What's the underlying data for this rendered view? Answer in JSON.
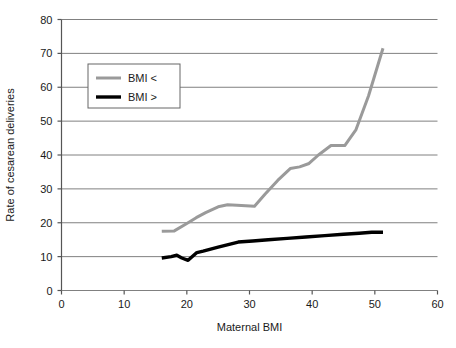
{
  "chart_data": {
    "type": "line",
    "title": "",
    "xlabel": "Maternal BMI",
    "ylabel": "Rate of cesarean deliveries",
    "xlim": [
      0,
      60
    ],
    "ylim": [
      0,
      80
    ],
    "xticks": [
      "0",
      "10",
      "20",
      "30",
      "40",
      "50",
      "60"
    ],
    "yticks": [
      "0",
      "10",
      "20",
      "30",
      "40",
      "50",
      "60",
      "70",
      "80"
    ],
    "xtick_step": 10,
    "ytick_step": 10,
    "grid": "horizontal",
    "legend_position": "upper-left-inside",
    "series": [
      {
        "name": "BMI <",
        "color": "#9a9a9a",
        "width": 3,
        "x": [
          16.0,
          18.0,
          20.0,
          21.5,
          23.0,
          25.0,
          26.5,
          28.0,
          30.8,
          32.5,
          34.5,
          36.5,
          38.0,
          39.5,
          41.0,
          43.0,
          45.2,
          47.0,
          49.0,
          51.3
        ],
        "y": [
          17.5,
          17.6,
          19.8,
          21.5,
          23.0,
          24.7,
          25.3,
          25.2,
          24.9,
          28.5,
          32.5,
          36.0,
          36.5,
          37.5,
          40.0,
          42.8,
          42.8,
          47.5,
          57.5,
          71.5
        ]
      },
      {
        "name": "BMI >",
        "color": "#000000",
        "width": 3.4,
        "x": [
          16.0,
          17.5,
          18.4,
          19.2,
          20.2,
          21.6,
          22.6,
          25.0,
          28.2,
          30.5,
          33.0,
          36.0,
          39.0,
          42.0,
          45.0,
          47.5,
          49.5,
          51.3
        ],
        "y": [
          9.6,
          10.0,
          10.4,
          9.6,
          8.9,
          11.2,
          11.6,
          12.8,
          14.3,
          14.6,
          15.0,
          15.4,
          15.8,
          16.2,
          16.6,
          16.9,
          17.2,
          17.2
        ]
      }
    ],
    "legend": [
      {
        "label": "BMI <",
        "color": "#9a9a9a"
      },
      {
        "label": "BMI >",
        "color": "#000000"
      }
    ],
    "colors": {
      "axis": "#555555",
      "grid": "#808080",
      "background": "#ffffff",
      "text": "#1a1a1a",
      "legend_border": "#666666"
    }
  }
}
